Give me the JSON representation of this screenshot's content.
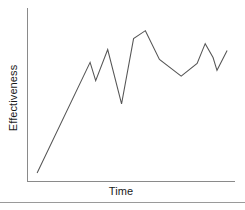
{
  "chart_data": {
    "type": "line",
    "title": "",
    "subtitle": "",
    "xlabel": "Time",
    "ylabel": "Effectiveness",
    "grid": false,
    "legend": null,
    "legend_position": "none",
    "axis_ticks": {
      "x": [],
      "y": []
    },
    "xlim": [
      0,
      1
    ],
    "ylim": [
      0,
      1
    ],
    "annotations": [],
    "series": [
      {
        "name": "Effectiveness over Time",
        "color": "#555555",
        "points": [
          {
            "x": 0.044,
            "y": 0.046
          },
          {
            "x": 0.3,
            "y": 0.686
          },
          {
            "x": 0.327,
            "y": 0.58
          },
          {
            "x": 0.385,
            "y": 0.76
          },
          {
            "x": 0.452,
            "y": 0.446
          },
          {
            "x": 0.51,
            "y": 0.823
          },
          {
            "x": 0.567,
            "y": 0.869
          },
          {
            "x": 0.635,
            "y": 0.703
          },
          {
            "x": 0.74,
            "y": 0.606
          },
          {
            "x": 0.817,
            "y": 0.68
          },
          {
            "x": 0.856,
            "y": 0.794
          },
          {
            "x": 0.894,
            "y": 0.714
          },
          {
            "x": 0.913,
            "y": 0.64
          },
          {
            "x": 0.962,
            "y": 0.754
          }
        ]
      }
    ]
  },
  "axes": {
    "x_label": "Time",
    "y_label": "Effectiveness",
    "line_color": "#555555",
    "axis_color": "#8a8a8a",
    "rule_color": "#9a9a9a"
  }
}
